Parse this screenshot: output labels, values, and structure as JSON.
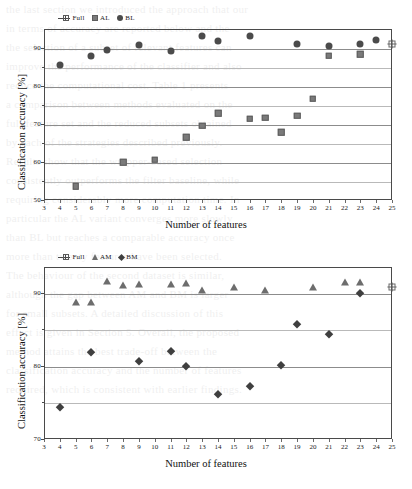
{
  "figures": [
    {
      "id": "top",
      "legend": [
        {
          "label": "Full",
          "marker": "line-cross"
        },
        {
          "label": "AL",
          "marker": "square"
        },
        {
          "label": "BL",
          "marker": "circle"
        }
      ],
      "chart_data": {
        "type": "scatter",
        "title": "",
        "xlabel": "Number of features",
        "ylabel": "Classification accuracy [%]",
        "xlim": [
          3,
          25
        ],
        "ylim": [
          50,
          95
        ],
        "xticks": [
          3,
          4,
          5,
          6,
          7,
          8,
          9,
          10,
          11,
          12,
          13,
          14,
          15,
          16,
          17,
          18,
          19,
          20,
          21,
          22,
          23,
          24,
          25
        ],
        "yticks": [
          50,
          60,
          70,
          80,
          90
        ],
        "yminorticks": [
          55,
          65,
          75,
          85
        ],
        "grid": true,
        "legend_position": "top-left",
        "series": [
          {
            "name": "BL",
            "marker": "circle",
            "color": "#4b4b4b",
            "points": [
              {
                "x": 4,
                "y": 85.4
              },
              {
                "x": 6,
                "y": 87.9
              },
              {
                "x": 7,
                "y": 89.4
              },
              {
                "x": 9,
                "y": 90.7
              },
              {
                "x": 11,
                "y": 89.2
              },
              {
                "x": 13,
                "y": 93.1
              },
              {
                "x": 14,
                "y": 91.8
              },
              {
                "x": 16,
                "y": 93.1
              },
              {
                "x": 19,
                "y": 91.0
              },
              {
                "x": 21,
                "y": 90.4
              },
              {
                "x": 23,
                "y": 91.0
              },
              {
                "x": 24,
                "y": 92.2
              }
            ]
          },
          {
            "name": "AL",
            "marker": "square",
            "color": "#7a7a7a",
            "points": [
              {
                "x": 5,
                "y": 53.6
              },
              {
                "x": 8,
                "y": 60.0
              },
              {
                "x": 10,
                "y": 60.6
              },
              {
                "x": 12,
                "y": 66.5
              },
              {
                "x": 13,
                "y": 69.5
              },
              {
                "x": 14,
                "y": 72.8
              },
              {
                "x": 16,
                "y": 71.4
              },
              {
                "x": 17,
                "y": 71.7
              },
              {
                "x": 18,
                "y": 67.8
              },
              {
                "x": 19,
                "y": 72.2
              },
              {
                "x": 20,
                "y": 76.7
              },
              {
                "x": 21,
                "y": 87.9
              },
              {
                "x": 23,
                "y": 88.4
              }
            ]
          },
          {
            "name": "Full",
            "marker": "cross",
            "color": "#4a4a4a",
            "points": [
              {
                "x": 25,
                "y": 91.0
              }
            ]
          }
        ]
      }
    },
    {
      "id": "bottom",
      "legend": [
        {
          "label": "Full",
          "marker": "line-cross"
        },
        {
          "label": "AM",
          "marker": "triangle"
        },
        {
          "label": "BM",
          "marker": "diamond"
        }
      ],
      "chart_data": {
        "type": "scatter",
        "title": "",
        "xlabel": "Number of features",
        "ylabel": "Classification accuracy [%]",
        "xlim": [
          3,
          25
        ],
        "ylim": [
          70,
          93.5
        ],
        "xticks": [
          3,
          4,
          5,
          6,
          7,
          8,
          9,
          10,
          11,
          12,
          13,
          14,
          15,
          16,
          17,
          18,
          19,
          20,
          21,
          22,
          23,
          24,
          25
        ],
        "yticks": [
          70,
          80,
          90
        ],
        "yminorticks": [
          75,
          85
        ],
        "grid": true,
        "legend_position": "top-left",
        "series": [
          {
            "name": "AM",
            "marker": "triangle",
            "color": "#6d6d6d",
            "points": [
              {
                "x": 5,
                "y": 88.7
              },
              {
                "x": 6,
                "y": 88.7
              },
              {
                "x": 7,
                "y": 91.6
              },
              {
                "x": 8,
                "y": 91.1
              },
              {
                "x": 9,
                "y": 91.2
              },
              {
                "x": 11,
                "y": 91.2
              },
              {
                "x": 12,
                "y": 91.3
              },
              {
                "x": 13,
                "y": 90.3
              },
              {
                "x": 15,
                "y": 90.8
              },
              {
                "x": 17,
                "y": 90.3
              },
              {
                "x": 20,
                "y": 90.8
              },
              {
                "x": 22,
                "y": 91.5
              },
              {
                "x": 23,
                "y": 91.5
              }
            ]
          },
          {
            "name": "BM",
            "marker": "diamond",
            "color": "#3f3f3f",
            "points": [
              {
                "x": 4,
                "y": 74.4
              },
              {
                "x": 6,
                "y": 81.9
              },
              {
                "x": 9,
                "y": 80.6
              },
              {
                "x": 11,
                "y": 82.0
              },
              {
                "x": 12,
                "y": 80.0
              },
              {
                "x": 14,
                "y": 76.2
              },
              {
                "x": 16,
                "y": 77.3
              },
              {
                "x": 18,
                "y": 80.1
              },
              {
                "x": 19,
                "y": 85.7
              },
              {
                "x": 21,
                "y": 84.3
              },
              {
                "x": 23,
                "y": 89.9
              }
            ]
          },
          {
            "name": "Full",
            "marker": "cross",
            "color": "#4a4a4a",
            "points": [
              {
                "x": 25,
                "y": 90.8
              }
            ]
          }
        ]
      }
    }
  ],
  "ghost_text": {
    "lines": [
      "the last section we introduced the approach that our",
      "in terms of accuracy are reported below and the",
      "the selection of a subset of relevant features can",
      "improve the performance of the classifier and also",
      "reduce the computational cost. Table 1 presents",
      "a comparison between methods evaluated on the",
      "full feature set and the reduced subsets obtained",
      "by each of the strategies described previously.",
      "",
      "Results show that the wrapper-based selection",
      "consistently outperforms the filter baseline, while",
      "requiring considerably more computation time. In",
      "particular the AL variant converges more slowly",
      "than BL but reaches a comparable accuracy once",
      "more than twenty features have been selected.",
      "The behaviour of the second dataset is similar,",
      "although the gap between AM and BM is larger",
      "for small subsets. A detailed discussion of this",
      "effect is given in Section 5. Overall, the proposed",
      "method attains the best trade-off between the",
      "classification accuracy and the number of features",
      "required, which is consistent with earlier findings."
    ]
  }
}
